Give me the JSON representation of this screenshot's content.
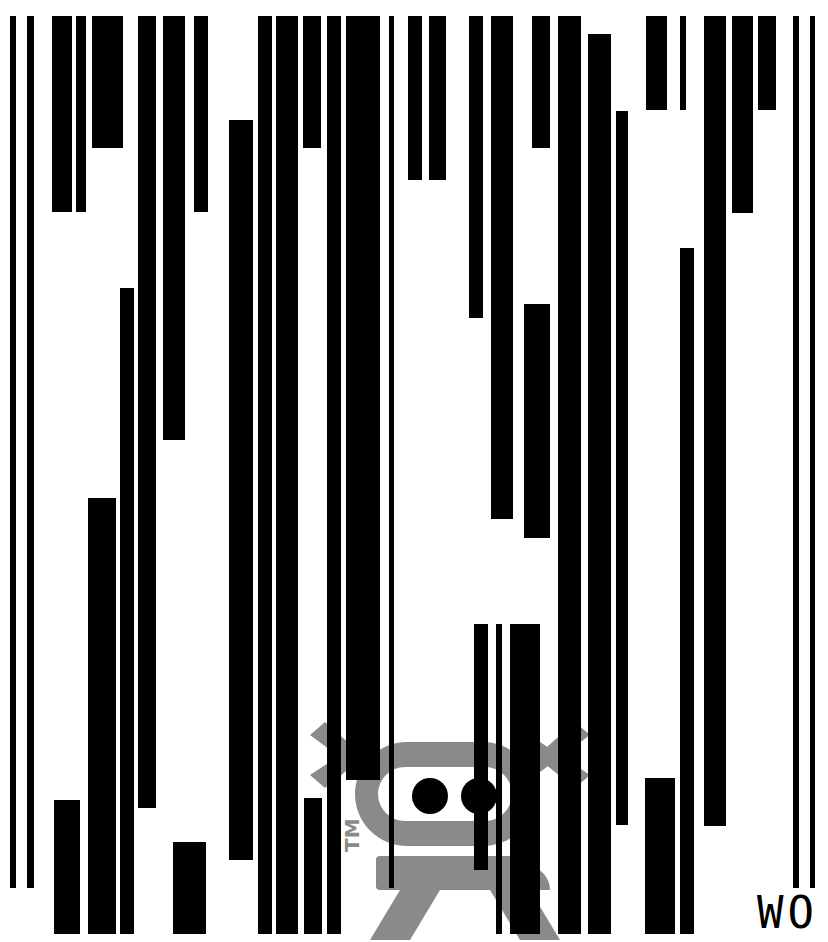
{
  "artwork": {
    "mark_text": "WO",
    "trademark": "TM",
    "colors": {
      "bar": "#000000",
      "robot": "#8a8a8a",
      "background": "#ffffff"
    },
    "bars": [
      [
        10,
        16,
        6,
        872
      ],
      [
        27,
        16,
        7,
        872
      ],
      [
        52,
        16,
        20,
        196
      ],
      [
        76,
        16,
        10,
        196
      ],
      [
        92,
        16,
        31,
        132
      ],
      [
        138,
        16,
        18,
        792
      ],
      [
        163,
        16,
        22,
        424
      ],
      [
        194,
        16,
        14,
        196
      ],
      [
        229,
        120,
        24,
        740
      ],
      [
        258,
        16,
        14,
        918
      ],
      [
        276,
        16,
        22,
        918
      ],
      [
        303,
        16,
        18,
        132
      ],
      [
        327,
        16,
        14,
        918
      ],
      [
        346,
        16,
        34,
        764
      ],
      [
        389,
        16,
        5,
        872
      ],
      [
        408,
        16,
        14,
        164
      ],
      [
        429,
        16,
        17,
        164
      ],
      [
        469,
        16,
        14,
        302
      ],
      [
        491,
        16,
        22,
        503
      ],
      [
        532,
        16,
        18,
        132
      ],
      [
        558,
        16,
        23,
        918
      ],
      [
        588,
        34,
        23,
        900
      ],
      [
        616,
        111,
        12,
        714
      ],
      [
        646,
        16,
        21,
        94
      ],
      [
        680,
        16,
        6,
        94
      ],
      [
        704,
        16,
        22,
        810
      ],
      [
        732,
        16,
        21,
        197
      ],
      [
        758,
        16,
        18,
        94
      ],
      [
        793,
        16,
        6,
        872
      ],
      [
        810,
        16,
        5,
        872
      ],
      [
        120,
        288,
        14,
        646
      ],
      [
        88,
        498,
        28,
        436
      ],
      [
        54,
        800,
        26,
        134
      ],
      [
        173,
        842,
        33,
        92
      ],
      [
        304,
        798,
        18,
        136
      ],
      [
        524,
        304,
        26,
        234
      ],
      [
        474,
        624,
        14,
        246
      ],
      [
        496,
        624,
        6,
        310
      ],
      [
        510,
        624,
        30,
        310
      ],
      [
        680,
        248,
        14,
        686
      ],
      [
        645,
        778,
        30,
        156
      ]
    ]
  }
}
